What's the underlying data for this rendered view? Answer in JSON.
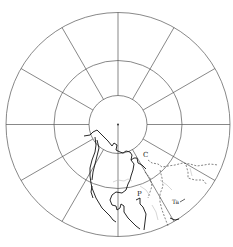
{
  "map": {
    "projection": "polar-azimuthal",
    "center": {
      "x": 118,
      "y": 124.5
    },
    "circles": {
      "inner_radius": 29,
      "middle_radius": 64,
      "outer_radius": 112
    },
    "meridian_count": 12,
    "pole_marker": "dot",
    "colors": {
      "grid": "#555555",
      "coast": "#111111",
      "boundary": "#333333",
      "background": "#ffffff"
    },
    "labels": [
      {
        "id": "C",
        "text": "C"
      },
      {
        "id": "P",
        "text": "P"
      },
      {
        "id": "Ta",
        "text": "Ta"
      }
    ]
  }
}
